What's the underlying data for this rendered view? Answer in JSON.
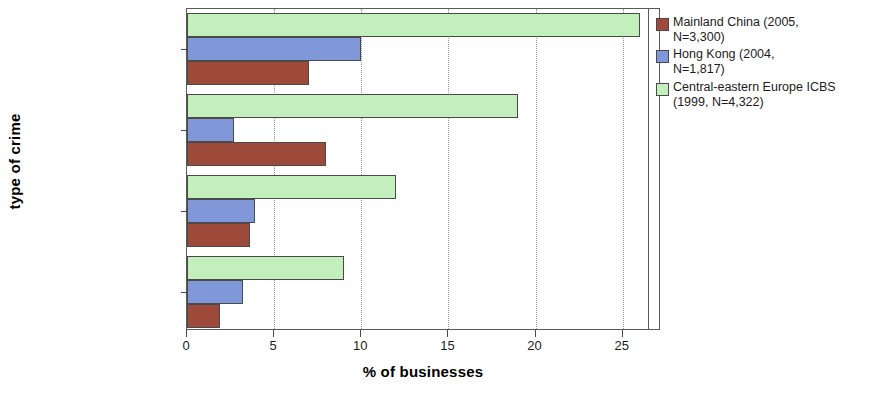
{
  "chart_data": {
    "type": "bar",
    "orientation": "horizontal",
    "title": "",
    "xlabel": "% of businesses",
    "ylabel": "type of crime",
    "xlim": [
      0,
      27.2
    ],
    "xticks": [
      0,
      5,
      10,
      15,
      20,
      25
    ],
    "xtick_labels": [
      "0",
      "5",
      "10",
      "15",
      "20",
      "25"
    ],
    "grid": "vertical dotted gridlines at each x tick",
    "legend_position": "right",
    "categories": [
      "fraud by outsiders",
      "bribery",
      "fraud by employees",
      "extortion/intimidation"
    ],
    "series": [
      {
        "name": "Mainland China (2005, N=3,300)",
        "color": "#9e4a3a",
        "values": [
          7.0,
          8.0,
          3.6,
          1.9
        ]
      },
      {
        "name": "Hong Kong (2004, N=1,817)",
        "color": "#8097d8",
        "values": [
          10.0,
          2.7,
          3.9,
          3.2
        ]
      },
      {
        "name": "Central-eastern Europe ICBS (1999, N=4,322)",
        "color": "#c3efbd",
        "values": [
          26.0,
          19.0,
          12.0,
          9.0
        ]
      }
    ]
  },
  "axis": {
    "x_title": "% of businesses",
    "y_title": "type of crime",
    "x_tick_labels": [
      "0",
      "5",
      "10",
      "15",
      "20",
      "25"
    ],
    "y_tick_labels": [
      "fraud by outsiders",
      "bribery",
      "fraud by employees",
      "extortion/intimidation"
    ]
  },
  "legend": {
    "entries": [
      {
        "label": "Mainland China (2005,\nN=3,300)",
        "color": "#9e4a3a"
      },
      {
        "label": "Hong Kong (2004,\nN=1,817)",
        "color": "#8097d8"
      },
      {
        "label": "Central-eastern Europe ICBS\n(1999, N=4,322)",
        "color": "#c3efbd"
      }
    ]
  }
}
